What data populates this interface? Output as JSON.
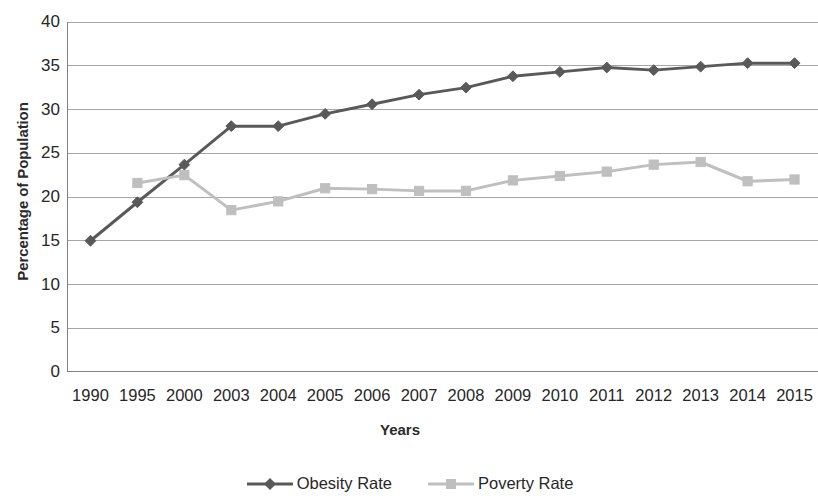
{
  "chart_data": {
    "type": "line",
    "title": "",
    "xlabel": "Years",
    "ylabel": "Percentage of Population",
    "categories": [
      "1990",
      "1995",
      "2000",
      "2003",
      "2004",
      "2005",
      "2006",
      "2007",
      "2008",
      "2009",
      "2010",
      "2011",
      "2012",
      "2013",
      "2014",
      "2015"
    ],
    "ylim": [
      0,
      40
    ],
    "y_ticks": [
      0,
      5,
      10,
      15,
      20,
      25,
      30,
      35,
      40
    ],
    "grid": true,
    "grid_axis": "y",
    "legend_position": "bottom",
    "series": [
      {
        "name": "Obesity Rate",
        "color": "#595959",
        "marker": "diamond",
        "values": [
          15.0,
          19.4,
          23.7,
          28.1,
          28.1,
          29.5,
          30.6,
          31.7,
          32.5,
          33.8,
          34.3,
          34.8,
          34.5,
          34.9,
          35.3,
          35.3
        ]
      },
      {
        "name": "Poverty Rate",
        "color": "#bfbfbf",
        "marker": "square",
        "values": [
          null,
          21.6,
          22.5,
          18.5,
          19.5,
          21.0,
          20.9,
          20.7,
          20.7,
          21.9,
          22.4,
          22.9,
          23.7,
          24.0,
          21.8,
          22.0
        ]
      }
    ]
  },
  "axes": {
    "y_title": "Percentage of Population",
    "x_title": "Years",
    "y_tick_labels": [
      "40",
      "35",
      "30",
      "25",
      "20",
      "15",
      "10",
      "5",
      "0"
    ],
    "x_tick_labels": [
      "1990",
      "1995",
      "2000",
      "2003",
      "2004",
      "2005",
      "2006",
      "2007",
      "2008",
      "2009",
      "2010",
      "2011",
      "2012",
      "2013",
      "2014",
      "2015"
    ]
  },
  "legend": {
    "items": [
      {
        "label": "Obesity Rate",
        "color": "#595959",
        "marker": "diamond"
      },
      {
        "label": "Poverty Rate",
        "color": "#bfbfbf",
        "marker": "square"
      }
    ]
  },
  "colors": {
    "obesity_line": "#595959",
    "poverty_line": "#bfbfbf",
    "gridline": "#a6a6a6",
    "axis": "#808080",
    "text": "#272727"
  }
}
